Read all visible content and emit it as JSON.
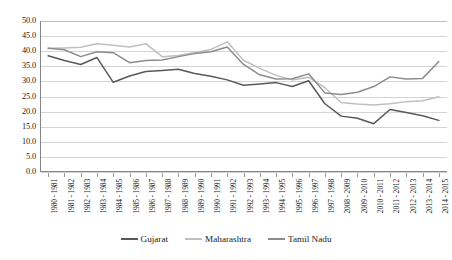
{
  "chart_data": {
    "type": "line",
    "title": "",
    "xlabel": "",
    "ylabel": "",
    "ylim": [
      0,
      50
    ],
    "ystep": 5,
    "grid": true,
    "legend_position": "bottom",
    "ytick_labels": [
      "50.0",
      "45.0",
      "40.0",
      "35.0",
      "30.0",
      "25.0",
      "20.0",
      "15.0",
      "10.0",
      "5.0",
      "0.0"
    ],
    "categories": [
      "1980 - 1981",
      "1981 - 1982",
      "1982 - 1983",
      "1983 - 1984",
      "1984 - 1985",
      "1985 - 1986",
      "1986 - 1987",
      "1987 - 1988",
      "1988 - 1989",
      "1989 - 1990",
      "1990 - 1991",
      "1991 - 1992",
      "1992 - 1993",
      "1993 - 1994",
      "1994 - 1995",
      "1995 - 1996",
      "1996 - 1997",
      "1997 - 1998",
      "2008 - 2009",
      "2009 - 2010",
      "2010 - 2011",
      "2011 - 2012",
      "2012 - 2013",
      "2013 - 2014",
      "2014 - 2015"
    ],
    "series": [
      {
        "name": "Gujarat",
        "color": "#595959",
        "values": [
          38.5,
          36.9,
          35.6,
          37.9,
          29.7,
          31.8,
          33.3,
          33.6,
          34.0,
          32.6,
          31.7,
          30.5,
          28.7,
          29.1,
          29.6,
          28.3,
          30.2,
          22.6,
          18.5,
          17.8,
          16.0,
          20.7,
          19.7,
          18.6,
          17.1
        ]
      },
      {
        "name": "Maharashtra",
        "color": "#bfbfbf",
        "values": [
          41.0,
          41.1,
          41.3,
          42.5,
          42.0,
          41.4,
          42.5,
          38.2,
          38.6,
          39.6,
          40.6,
          43.1,
          37.0,
          34.3,
          32.0,
          30.5,
          31.4,
          27.9,
          23.0,
          22.5,
          22.2,
          22.6,
          23.3,
          23.6,
          24.9
        ]
      },
      {
        "name": "Tamil Nadu",
        "color": "#8c8c8c",
        "values": [
          41.0,
          40.5,
          38.2,
          39.8,
          39.5,
          36.2,
          36.9,
          37.1,
          38.2,
          39.2,
          39.8,
          41.4,
          35.6,
          32.2,
          30.8,
          30.9,
          32.5,
          26.2,
          25.7,
          26.4,
          28.3,
          31.5,
          30.8,
          31.0,
          36.6
        ]
      }
    ]
  },
  "legend": {
    "items": [
      {
        "label": "Gujarat"
      },
      {
        "label": "Maharashtra"
      },
      {
        "label": "Tamil Nadu"
      }
    ]
  }
}
